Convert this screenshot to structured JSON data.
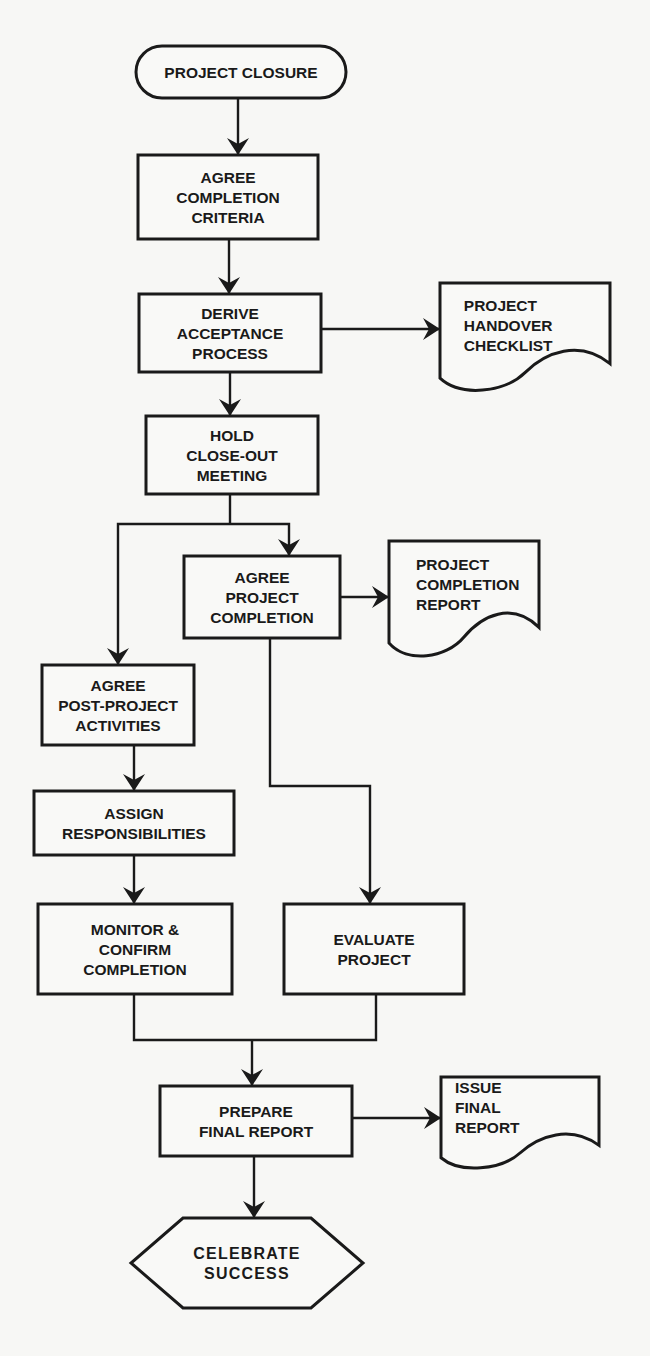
{
  "diagram": {
    "type": "flowchart",
    "nodes": [
      {
        "id": "project_closure",
        "shape": "terminator",
        "lines": [
          "PROJECT CLOSURE"
        ]
      },
      {
        "id": "agree_completion_criteria",
        "shape": "process",
        "lines": [
          "AGREE",
          "COMPLETION",
          "CRITERIA"
        ]
      },
      {
        "id": "derive_acceptance_process",
        "shape": "process",
        "lines": [
          "DERIVE",
          "ACCEPTANCE",
          "PROCESS"
        ]
      },
      {
        "id": "project_handover_checklist",
        "shape": "document",
        "lines": [
          "PROJECT",
          "HANDOVER",
          "CHECKLIST"
        ]
      },
      {
        "id": "hold_close_out_meeting",
        "shape": "process",
        "lines": [
          "HOLD",
          "CLOSE-OUT",
          "MEETING"
        ]
      },
      {
        "id": "agree_project_completion",
        "shape": "process",
        "lines": [
          "AGREE",
          "PROJECT",
          "COMPLETION"
        ]
      },
      {
        "id": "project_completion_report",
        "shape": "document",
        "lines": [
          "PROJECT",
          "COMPLETION",
          "REPORT"
        ]
      },
      {
        "id": "agree_post_project_activities",
        "shape": "process",
        "lines": [
          "AGREE",
          "POST-PROJECT",
          "ACTIVITIES"
        ]
      },
      {
        "id": "assign_responsibilities",
        "shape": "process",
        "lines": [
          "ASSIGN",
          "RESPONSIBILITIES"
        ]
      },
      {
        "id": "monitor_confirm_completion",
        "shape": "process",
        "lines": [
          "MONITOR &",
          "CONFIRM",
          "COMPLETION"
        ]
      },
      {
        "id": "evaluate_project",
        "shape": "process",
        "lines": [
          "EVALUATE",
          "PROJECT"
        ]
      },
      {
        "id": "prepare_final_report",
        "shape": "process",
        "lines": [
          "PREPARE",
          "FINAL REPORT"
        ]
      },
      {
        "id": "issue_final_report",
        "shape": "document",
        "lines": [
          "ISSUE",
          "FINAL",
          "REPORT"
        ]
      },
      {
        "id": "celebrate_success",
        "shape": "hexagon",
        "lines": [
          "CELEBRATE",
          "SUCCESS"
        ]
      }
    ],
    "edges": [
      {
        "from": "project_closure",
        "to": "agree_completion_criteria"
      },
      {
        "from": "agree_completion_criteria",
        "to": "derive_acceptance_process"
      },
      {
        "from": "derive_acceptance_process",
        "to": "project_handover_checklist"
      },
      {
        "from": "derive_acceptance_process",
        "to": "hold_close_out_meeting"
      },
      {
        "from": "hold_close_out_meeting",
        "to": "agree_project_completion"
      },
      {
        "from": "hold_close_out_meeting",
        "to": "agree_post_project_activities"
      },
      {
        "from": "agree_project_completion",
        "to": "project_completion_report"
      },
      {
        "from": "agree_project_completion",
        "to": "evaluate_project"
      },
      {
        "from": "agree_post_project_activities",
        "to": "assign_responsibilities"
      },
      {
        "from": "assign_responsibilities",
        "to": "monitor_confirm_completion"
      },
      {
        "from": "monitor_confirm_completion",
        "to": "prepare_final_report"
      },
      {
        "from": "evaluate_project",
        "to": "prepare_final_report"
      },
      {
        "from": "prepare_final_report",
        "to": "issue_final_report"
      },
      {
        "from": "prepare_final_report",
        "to": "celebrate_success"
      }
    ]
  }
}
